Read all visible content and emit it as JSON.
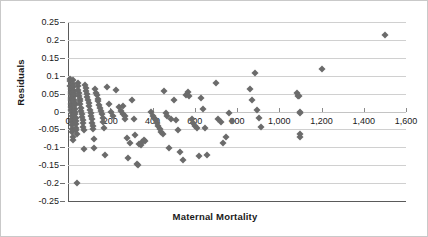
{
  "chart_data": {
    "type": "scatter",
    "title": "",
    "xlabel": "Maternal Mortality",
    "ylabel": "Residuals",
    "xlim": [
      0,
      1600
    ],
    "ylim": [
      -0.25,
      0.25
    ],
    "xticks": [
      0,
      200,
      400,
      600,
      800,
      1000,
      1200,
      1400,
      1600
    ],
    "xtick_labels": [
      "0",
      "200",
      "400",
      "600",
      "800",
      "1,000",
      "1,200",
      "1,400",
      "1,600"
    ],
    "yticks": [
      0.25,
      0.2,
      0.15,
      0.1,
      0.05,
      0,
      -0.05,
      -0.1,
      -0.15,
      -0.2,
      -0.25
    ],
    "ytick_labels": [
      "0.25",
      "0.2",
      "0.15",
      "0.1",
      "0.05",
      "0",
      "-0.05",
      "-0.1",
      "-0.15",
      "-0.2",
      "-0.25"
    ],
    "grid": "horizontal",
    "legend": "none",
    "marker": "diamond",
    "marker_color": "#6b6b6b",
    "points": [
      [
        8,
        0.092
      ],
      [
        10,
        0.085
      ],
      [
        10,
        0.072
      ],
      [
        12,
        0.064
      ],
      [
        12,
        0.055
      ],
      [
        14,
        0.048
      ],
      [
        14,
        0.038
      ],
      [
        15,
        0.031
      ],
      [
        15,
        0.021
      ],
      [
        16,
        0.012
      ],
      [
        16,
        0.004
      ],
      [
        17,
        -0.004
      ],
      [
        18,
        -0.012
      ],
      [
        18,
        -0.021
      ],
      [
        19,
        -0.03
      ],
      [
        20,
        -0.038
      ],
      [
        20,
        -0.048
      ],
      [
        21,
        -0.058
      ],
      [
        22,
        -0.072
      ],
      [
        22,
        -0.079
      ],
      [
        24,
        0.088
      ],
      [
        25,
        0.078
      ],
      [
        26,
        0.068
      ],
      [
        27,
        0.058
      ],
      [
        28,
        0.05
      ],
      [
        29,
        0.042
      ],
      [
        30,
        0.033
      ],
      [
        31,
        0.025
      ],
      [
        32,
        0.017
      ],
      [
        33,
        0.008
      ],
      [
        34,
        0.0
      ],
      [
        35,
        -0.008
      ],
      [
        36,
        -0.017
      ],
      [
        37,
        -0.026
      ],
      [
        38,
        -0.035
      ],
      [
        39,
        -0.045
      ],
      [
        40,
        -0.052
      ],
      [
        41,
        -0.062
      ],
      [
        42,
        -0.2
      ],
      [
        45,
        0.08
      ],
      [
        47,
        0.07
      ],
      [
        49,
        0.06
      ],
      [
        51,
        0.052
      ],
      [
        53,
        0.044
      ],
      [
        55,
        0.036
      ],
      [
        57,
        0.028
      ],
      [
        59,
        0.02
      ],
      [
        61,
        0.011
      ],
      [
        63,
        0.002
      ],
      [
        65,
        -0.006
      ],
      [
        67,
        -0.014
      ],
      [
        69,
        -0.023
      ],
      [
        71,
        -0.032
      ],
      [
        73,
        -0.042
      ],
      [
        75,
        -0.052
      ],
      [
        77,
        -0.104
      ],
      [
        80,
        0.075
      ],
      [
        83,
        0.066
      ],
      [
        86,
        0.057
      ],
      [
        89,
        0.049
      ],
      [
        92,
        0.04
      ],
      [
        95,
        0.032
      ],
      [
        98,
        0.023
      ],
      [
        101,
        0.014
      ],
      [
        104,
        0.005
      ],
      [
        107,
        -0.004
      ],
      [
        110,
        -0.013
      ],
      [
        113,
        -0.022
      ],
      [
        115,
        -0.031
      ],
      [
        118,
        -0.04
      ],
      [
        120,
        -0.05
      ],
      [
        122,
        -0.076
      ],
      [
        124,
        -0.103
      ],
      [
        128,
        0.062
      ],
      [
        132,
        0.053
      ],
      [
        136,
        0.045
      ],
      [
        140,
        0.036
      ],
      [
        144,
        0.028
      ],
      [
        148,
        0.019
      ],
      [
        152,
        0.01
      ],
      [
        156,
        0.001
      ],
      [
        160,
        -0.008
      ],
      [
        164,
        -0.018
      ],
      [
        168,
        -0.028
      ],
      [
        172,
        -0.045
      ],
      [
        176,
        -0.121
      ],
      [
        185,
        0.069
      ],
      [
        195,
        0.02
      ],
      [
        205,
        -0.002
      ],
      [
        215,
        -0.013
      ],
      [
        228,
        0.061
      ],
      [
        240,
        0.012
      ],
      [
        252,
        0.002
      ],
      [
        258,
        -0.006
      ],
      [
        262,
        0.016
      ],
      [
        268,
        -0.012
      ],
      [
        272,
        -0.022
      ],
      [
        278,
        -0.074
      ],
      [
        285,
        -0.131
      ],
      [
        295,
        -0.088
      ],
      [
        305,
        0.031
      ],
      [
        312,
        -0.02
      ],
      [
        318,
        -0.066
      ],
      [
        325,
        -0.146
      ],
      [
        330,
        -0.15
      ],
      [
        338,
        -0.09
      ],
      [
        345,
        -0.094
      ],
      [
        352,
        -0.086
      ],
      [
        358,
        -0.081
      ],
      [
        365,
        -0.083
      ],
      [
        395,
        0.0
      ],
      [
        402,
        -0.012
      ],
      [
        408,
        -0.018
      ],
      [
        415,
        -0.025
      ],
      [
        422,
        -0.031
      ],
      [
        428,
        -0.04
      ],
      [
        435,
        -0.049
      ],
      [
        442,
        -0.058
      ],
      [
        448,
        -0.063
      ],
      [
        455,
        0.056
      ],
      [
        462,
        -0.004
      ],
      [
        470,
        -0.012
      ],
      [
        478,
        -0.102
      ],
      [
        486,
        -0.021
      ],
      [
        500,
        0.032
      ],
      [
        512,
        -0.025
      ],
      [
        520,
        -0.053
      ],
      [
        530,
        -0.113
      ],
      [
        545,
        -0.135
      ],
      [
        560,
        0.046
      ],
      [
        568,
        0.055
      ],
      [
        575,
        0.043
      ],
      [
        585,
        -0.022
      ],
      [
        592,
        -0.031
      ],
      [
        600,
        -0.04
      ],
      [
        610,
        -0.045
      ],
      [
        618,
        -0.124
      ],
      [
        628,
        0.039
      ],
      [
        640,
        0.008
      ],
      [
        648,
        -0.046
      ],
      [
        658,
        -0.122
      ],
      [
        700,
        0.079
      ],
      [
        712,
        -0.022
      ],
      [
        722,
        -0.03
      ],
      [
        735,
        -0.088
      ],
      [
        748,
        -0.07
      ],
      [
        762,
        -0.005
      ],
      [
        775,
        -0.026
      ],
      [
        860,
        0.062
      ],
      [
        872,
        0.031
      ],
      [
        885,
        0.108
      ],
      [
        895,
        0.004
      ],
      [
        905,
        -0.017
      ],
      [
        915,
        -0.043
      ],
      [
        1085,
        0.053
      ],
      [
        1090,
        0.044
      ],
      [
        1095,
        0.042
      ],
      [
        1100,
        -0.063
      ],
      [
        1100,
        0.0
      ],
      [
        1100,
        -0.005
      ],
      [
        1100,
        -0.07
      ],
      [
        1200,
        0.12
      ],
      [
        1500,
        0.213
      ]
    ]
  },
  "axis": {
    "x_title": "Maternal Mortality",
    "y_title": "Residuals"
  }
}
